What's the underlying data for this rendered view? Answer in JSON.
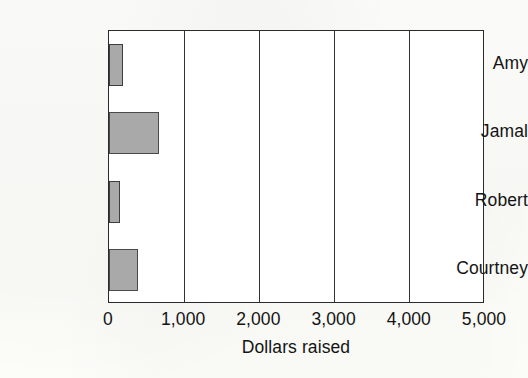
{
  "chart_data": {
    "type": "bar",
    "orientation": "horizontal",
    "title": "",
    "xlabel": "Dollars raised",
    "ylabel": "",
    "categories": [
      "Amy",
      "Jamal",
      "Robert",
      "Courtney"
    ],
    "values": [
      190,
      670,
      140,
      390
    ],
    "series": [
      {
        "name": "Dollars raised",
        "values": [
          190,
          670,
          140,
          390
        ]
      }
    ],
    "xlim": [
      0,
      5000
    ],
    "xticks": [
      0,
      1000,
      2000,
      3000,
      4000,
      5000
    ],
    "xtick_labels": [
      "0",
      "1,000",
      "2,000",
      "3,000",
      "4,000",
      "5,000"
    ],
    "grid": "vertical-only",
    "legend": "none",
    "bar_fill_color": "#a9a9a9",
    "bar_edge_color": "#4a4a4a",
    "axis_color": "#2b2b2b",
    "background_color": "#ffffff"
  },
  "axis": {
    "x_title": "Dollars raised",
    "ticks": [
      {
        "label": "0",
        "value": 0
      },
      {
        "label": "1,000",
        "value": 1000
      },
      {
        "label": "2,000",
        "value": 2000
      },
      {
        "label": "3,000",
        "value": 3000
      },
      {
        "label": "4,000",
        "value": 4000
      },
      {
        "label": "5,000",
        "value": 5000
      }
    ]
  },
  "bars": [
    {
      "label": "Amy",
      "value": 190
    },
    {
      "label": "Jamal",
      "value": 670
    },
    {
      "label": "Robert",
      "value": 140
    },
    {
      "label": "Courtney",
      "value": 390
    }
  ]
}
